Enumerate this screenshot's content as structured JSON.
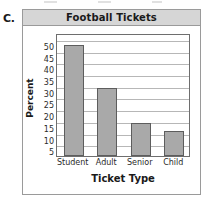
{
  "item_marker": "C.",
  "card": {
    "title": "Football Tickets"
  },
  "chart_data": {
    "type": "bar",
    "title": "Football Tickets",
    "categories": [
      "Student",
      "Adult",
      "Senior",
      "Child"
    ],
    "values": [
      47.5,
      29,
      14,
      10.5
    ],
    "xlabel": "Ticket Type",
    "ylabel": "Percent",
    "ylim": [
      0,
      52.5
    ],
    "yticks": [
      5,
      10,
      15,
      20,
      25,
      30,
      35,
      40,
      45,
      50
    ],
    "ytick_labels": [
      "5",
      "10",
      "15",
      "20",
      "25",
      "30",
      "35",
      "40",
      "45",
      "50"
    ],
    "grid": "horizontal",
    "legend": "none",
    "bar_color": "#a9a9a9",
    "bar_edge_color": "#5d5d5d",
    "gridline_color": "#b7b7b7",
    "header_color": "#d6d6d6",
    "border_color": "#9a9a9a"
  }
}
